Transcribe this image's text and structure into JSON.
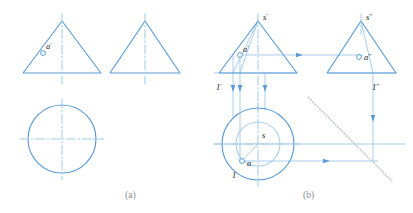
{
  "figure": {
    "colors": {
      "line": "#5b9bd5",
      "line_light": "#a8cdeb",
      "centerline": "#9ecbe8",
      "miter": "#b9bec4",
      "label": "#1a1a1a",
      "caption": "#8a8a8a",
      "background": "#ffffff"
    },
    "captions": [
      {
        "text": "(a)",
        "x": 125,
        "y": 190
      },
      {
        "text": "(b)",
        "x": 303,
        "y": 190
      }
    ]
  },
  "panel_a": {
    "name": "panel-a",
    "front_view": {
      "name": "front-view-triangle",
      "apex": {
        "x": 62,
        "y": 21
      },
      "base_left": {
        "x": 23,
        "y": 73
      },
      "base_right": {
        "x": 101,
        "y": 73
      },
      "axis": {
        "x": 62,
        "y1": 14,
        "y2": 84
      }
    },
    "side_view": {
      "name": "side-view-triangle",
      "apex": {
        "x": 145,
        "y": 21
      },
      "base_left": {
        "x": 110,
        "y": 73
      },
      "base_right": {
        "x": 180,
        "y": 73
      },
      "axis": {
        "x": 145,
        "y1": 14,
        "y2": 84
      }
    },
    "top_view": {
      "name": "top-view-circle",
      "center": {
        "x": 62,
        "y": 139
      },
      "radius": 34,
      "hcenterline": {
        "x1": 20,
        "x2": 104,
        "y": 139
      },
      "vcenterline": {
        "x": 62,
        "y1": 99,
        "y2": 180
      }
    },
    "point_marker": {
      "name": "point-a-prime-marker",
      "x": 43,
      "y": 53,
      "r": 2.4,
      "label": "a",
      "prime": "′",
      "label_x": 46,
      "label_y": 49
    }
  },
  "panel_b": {
    "name": "panel-b",
    "front_view": {
      "name": "front-view-triangle",
      "apex": {
        "x": 258,
        "y": 21
      },
      "base_left": {
        "x": 219,
        "y": 73
      },
      "base_right": {
        "x": 297,
        "y": 73
      },
      "axis": {
        "x": 258,
        "y1": 14,
        "y2": 110
      }
    },
    "side_view": {
      "name": "side-view-triangle",
      "apex": {
        "x": 361,
        "y": 21
      },
      "base_left": {
        "x": 327,
        "y": 73
      },
      "base_right": {
        "x": 396,
        "y": 73
      },
      "axis": {
        "x": 361,
        "y1": 14,
        "y2": 34
      }
    },
    "top_view": {
      "name": "top-view-circles",
      "center": {
        "x": 258,
        "y": 144
      },
      "outer_radius": 36,
      "inner_radius": 22,
      "hcenterline": {
        "x1": 214,
        "x2": 303,
        "y": 144
      },
      "vcenterline": {
        "x": 258,
        "y1": 104,
        "y2": 186
      }
    },
    "labels": [
      {
        "name": "label-s-prime",
        "text": "s",
        "mark": "′",
        "x": 263,
        "y": 20
      },
      {
        "name": "label-a-prime",
        "text": "a",
        "mark": "′",
        "x": 243,
        "y": 52
      },
      {
        "name": "label-one-prime",
        "text": "1",
        "mark": "′",
        "x": 216,
        "y": 90
      },
      {
        "name": "label-s-double-prime",
        "text": "s",
        "mark": "″",
        "x": 366,
        "y": 20
      },
      {
        "name": "label-a-double-prime",
        "text": "a",
        "mark": "″",
        "x": 364,
        "y": 60
      },
      {
        "name": "label-one-double-prime",
        "text": "1",
        "mark": "″",
        "x": 372,
        "y": 90
      },
      {
        "name": "label-s",
        "text": "s",
        "mark": "",
        "x": 262,
        "y": 138
      },
      {
        "name": "label-a",
        "text": "a",
        "mark": "",
        "x": 247,
        "y": 166
      },
      {
        "name": "label-one",
        "text": "1",
        "mark": "",
        "x": 232,
        "y": 178
      }
    ],
    "point_markers": [
      {
        "name": "point-a-prime-marker",
        "x": 240,
        "y": 55,
        "r": 2.4
      },
      {
        "name": "point-a-double-prime-marker",
        "x": 359,
        "y": 57,
        "r": 2.4
      },
      {
        "name": "point-a-marker",
        "x": 242,
        "y": 161,
        "r": 2.4
      }
    ],
    "projection_lines": {
      "name": "projection-lines",
      "vertical_down": [
        {
          "x": 233,
          "y1": 55,
          "y2": 118
        },
        {
          "x": 240,
          "y1": 55,
          "y2": 162
        },
        {
          "x": 265,
          "y1": 73,
          "y2": 110
        },
        {
          "x": 373,
          "y1": 73,
          "y2": 160
        }
      ],
      "horizontal": [
        {
          "x1": 240,
          "y1": 55,
          "x2": 363,
          "y2": 55
        },
        {
          "x1": 214,
          "y1": 73,
          "x2": 297,
          "y2": 73
        },
        {
          "x1": 327,
          "y1": 73,
          "x2": 396,
          "y2": 73
        },
        {
          "x1": 240,
          "y1": 161,
          "x2": 378,
          "y2": 161
        },
        {
          "x1": 214,
          "y1": 144,
          "x2": 405,
          "y2": 144
        }
      ],
      "cone_generatrix": [
        {
          "x1": 258,
          "y1": 21,
          "x2": 233,
          "y2": 73
        },
        {
          "x1": 258,
          "y1": 21,
          "x2": 240,
          "y2": 73
        },
        {
          "x1": 361,
          "y1": 21,
          "x2": 373,
          "y2": 73
        },
        {
          "x1": 258,
          "y1": 144,
          "x2": 242,
          "y2": 161
        }
      ]
    },
    "arrows": [
      {
        "name": "arrow-right-upper",
        "x": 303,
        "y": 55,
        "dir": "right"
      },
      {
        "name": "arrow-right-lower",
        "x": 330,
        "y": 161,
        "dir": "right"
      },
      {
        "name": "arrow-down-1",
        "x": 233,
        "y": 92,
        "dir": "down"
      },
      {
        "name": "arrow-down-2",
        "x": 240,
        "y": 92,
        "dir": "down"
      },
      {
        "name": "arrow-down-3",
        "x": 265,
        "y": 92,
        "dir": "down"
      },
      {
        "name": "arrow-down-4",
        "x": 373,
        "y": 122,
        "dir": "down"
      }
    ],
    "miter_line": {
      "name": "miter-line-45",
      "x1": 308,
      "y1": 97,
      "x2": 392,
      "y2": 181
    }
  }
}
